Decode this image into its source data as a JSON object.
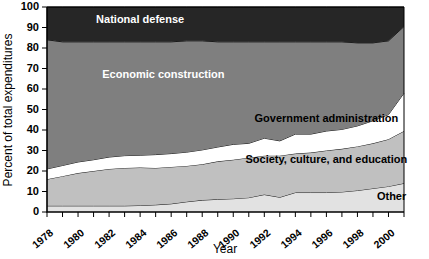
{
  "chart_data": {
    "type": "area",
    "stacked": true,
    "title": "",
    "xlabel": "Year",
    "ylabel": "Percent of total expenditures",
    "xlim": [
      1978,
      2001
    ],
    "ylim": [
      0,
      100
    ],
    "yticks": [
      0,
      10,
      20,
      30,
      40,
      50,
      60,
      70,
      80,
      90,
      100
    ],
    "xticks_labeled": [
      1978,
      1980,
      1982,
      1984,
      1986,
      1988,
      1990,
      1992,
      1994,
      1996,
      1998,
      2000
    ],
    "xtick_labels": [
      "1978",
      "1980",
      "1982",
      "1984",
      "1986",
      "1988",
      "1990",
      "1992",
      "1994",
      "1996",
      "1998",
      "2000"
    ],
    "grid": false,
    "legend_position": "inline-labels",
    "x": [
      1978,
      1979,
      1980,
      1981,
      1982,
      1983,
      1984,
      1985,
      1986,
      1987,
      1988,
      1989,
      1990,
      1991,
      1992,
      1993,
      1994,
      1995,
      1996,
      1997,
      1998,
      1999,
      2000,
      2001
    ],
    "series": [
      {
        "name": "Other",
        "color": "#e2e2e2",
        "label": "Other",
        "values": [
          3.0,
          3.0,
          3.0,
          3.0,
          3.0,
          3.0,
          3.2,
          3.5,
          4.0,
          5.0,
          5.8,
          6.2,
          6.5,
          7.0,
          8.5,
          7.2,
          9.5,
          9.5,
          9.5,
          9.8,
          10.5,
          11.5,
          12.5,
          14.0
        ]
      },
      {
        "name": "Society, culture, and education",
        "color": "#c0c0c0",
        "label": "Society, culture, and education",
        "values": [
          13.0,
          14.5,
          16.0,
          17.0,
          18.0,
          18.5,
          18.5,
          18.0,
          18.0,
          17.5,
          17.5,
          18.5,
          19.0,
          19.5,
          19.0,
          20.3,
          19.0,
          19.5,
          20.5,
          21.0,
          21.5,
          22.0,
          23.0,
          25.5
        ]
      },
      {
        "name": "Government administration",
        "color": "#ffffff",
        "label": "Government administration",
        "values": [
          5.0,
          5.2,
          5.4,
          5.5,
          5.8,
          6.0,
          6.0,
          6.5,
          6.5,
          6.7,
          7.0,
          7.0,
          7.5,
          7.0,
          8.5,
          7.2,
          9.5,
          9.0,
          9.5,
          9.5,
          10.0,
          11.0,
          12.0,
          18.5
        ]
      },
      {
        "name": "Economic construction",
        "color": "#7f7f7f",
        "label": "Economic construction",
        "values": [
          63.0,
          60.3,
          58.6,
          57.5,
          56.2,
          55.5,
          55.3,
          55.0,
          54.5,
          54.3,
          53.2,
          51.3,
          50.0,
          49.5,
          47.0,
          48.3,
          45.0,
          45.0,
          43.5,
          42.7,
          40.5,
          38.0,
          36.0,
          32.5
        ]
      },
      {
        "name": "National defense",
        "color": "#262626",
        "label": "National defense",
        "values": [
          16.0,
          17.0,
          17.0,
          17.0,
          17.0,
          17.0,
          17.0,
          17.0,
          17.0,
          16.5,
          16.5,
          17.0,
          17.0,
          17.0,
          17.0,
          17.0,
          17.0,
          17.0,
          17.0,
          17.0,
          17.5,
          17.5,
          16.5,
          9.5
        ]
      }
    ],
    "label_positions": [
      {
        "name": "National defense",
        "x": 1984.0,
        "y": 93.5,
        "anchor": "middle",
        "tone": "dark"
      },
      {
        "name": "Economic construction",
        "x": 1985.5,
        "y": 67.0,
        "anchor": "middle",
        "tone": "dark"
      },
      {
        "name": "Government administration",
        "x": 1996.0,
        "y": 45.5,
        "anchor": "middle",
        "tone": "light"
      },
      {
        "name": "Society, culture, and education",
        "x": 1996.0,
        "y": 25.5,
        "anchor": "middle",
        "tone": "light"
      },
      {
        "name": "Other",
        "x": 2000.2,
        "y": 7.5,
        "anchor": "middle",
        "tone": "light"
      }
    ]
  }
}
